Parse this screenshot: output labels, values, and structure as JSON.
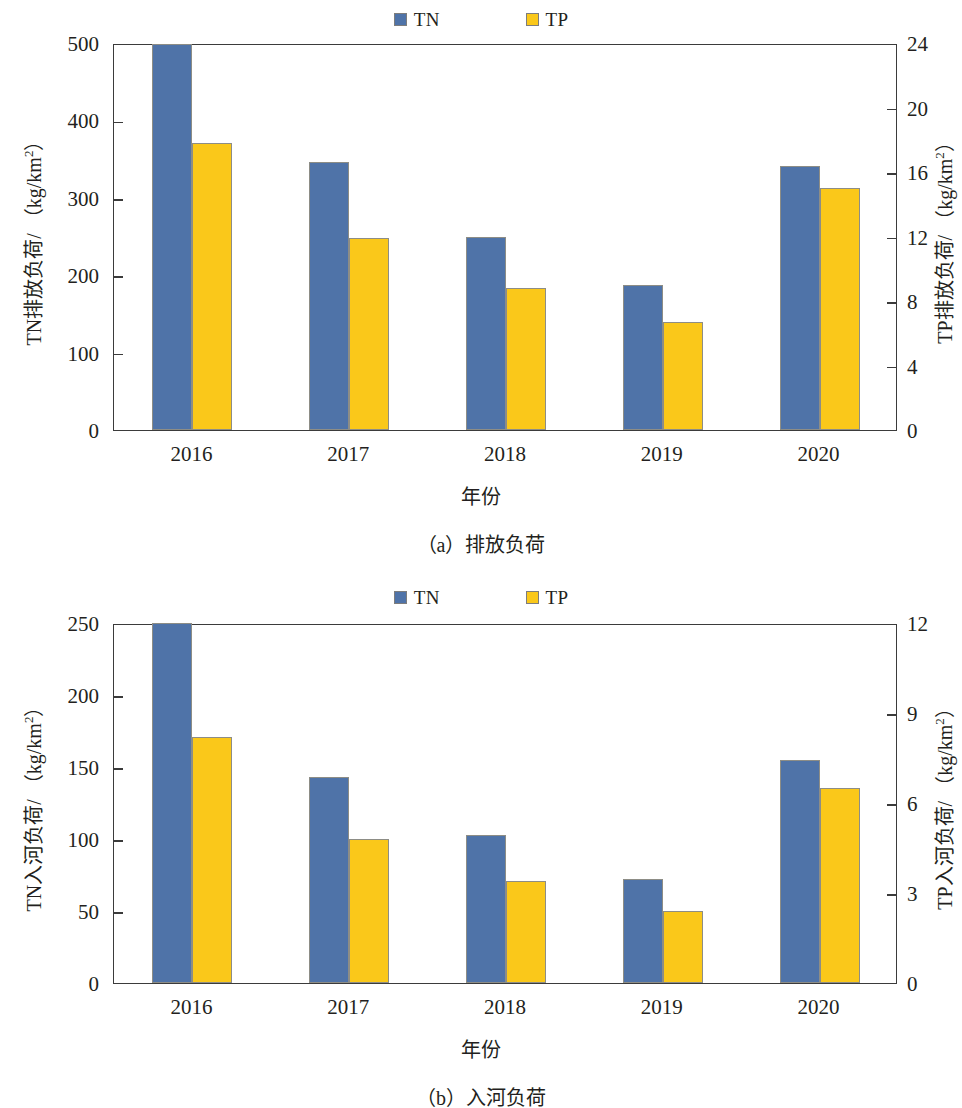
{
  "figure": {
    "panels": [
      {
        "id": "a",
        "caption": "（a）排放负荷",
        "legend": [
          {
            "label": "TN",
            "color": "#4f73a8",
            "icon": "legend-square-blue"
          },
          {
            "label": "TP",
            "color": "#fac81a",
            "icon": "legend-square-yellow"
          }
        ],
        "chart_data": {
          "type": "bar",
          "title": "",
          "subtitle": "（a）排放负荷",
          "xlabel": "年份",
          "categories": [
            "2016",
            "2017",
            "2018",
            "2019",
            "2020"
          ],
          "grid": false,
          "legend_position": "top-center",
          "axes": {
            "left": {
              "label": "TN排放负荷/ （kg/km²）",
              "ticks": [
                0,
                100,
                200,
                300,
                400,
                500
              ],
              "lim": [
                0,
                500
              ],
              "series": "TN"
            },
            "right": {
              "label": "TP排放负荷/ （kg/km²）",
              "ticks": [
                0,
                4,
                8,
                12,
                16,
                20,
                24
              ],
              "lim": [
                0,
                24
              ],
              "series": "TP"
            }
          },
          "series": [
            {
              "name": "TN",
              "axis": "left",
              "color": "#4f73a8",
              "values": [
                499,
                346,
                249,
                187,
                341
              ]
            },
            {
              "name": "TP",
              "axis": "right",
              "color": "#fac81a",
              "values": [
                17.8,
                11.9,
                8.8,
                6.7,
                15.0
              ]
            }
          ]
        }
      },
      {
        "id": "b",
        "caption": "（b）入河负荷",
        "legend": [
          {
            "label": "TN",
            "color": "#4f73a8",
            "icon": "legend-square-blue"
          },
          {
            "label": "TP",
            "color": "#fac81a",
            "icon": "legend-square-yellow"
          }
        ],
        "chart_data": {
          "type": "bar",
          "title": "",
          "subtitle": "（b）入河负荷",
          "xlabel": "年份",
          "categories": [
            "2016",
            "2017",
            "2018",
            "2019",
            "2020"
          ],
          "grid": false,
          "legend_position": "top-center",
          "axes": {
            "left": {
              "label": "TN入河负荷/ （kg/km²）",
              "ticks": [
                0,
                50,
                100,
                150,
                200,
                250
              ],
              "lim": [
                0,
                250
              ],
              "series": "TN"
            },
            "right": {
              "label": "TP入河负荷/ （kg/km²）",
              "ticks": [
                0,
                3,
                6,
                9,
                12
              ],
              "lim": [
                0,
                12
              ],
              "series": "TP"
            }
          },
          "series": [
            {
              "name": "TN",
              "axis": "left",
              "color": "#4f73a8",
              "values": [
                250,
                143,
                103,
                72,
                155
              ]
            },
            {
              "name": "TP",
              "axis": "right",
              "color": "#fac81a",
              "values": [
                8.2,
                4.8,
                3.4,
                2.4,
                6.5
              ]
            }
          ]
        }
      }
    ]
  }
}
